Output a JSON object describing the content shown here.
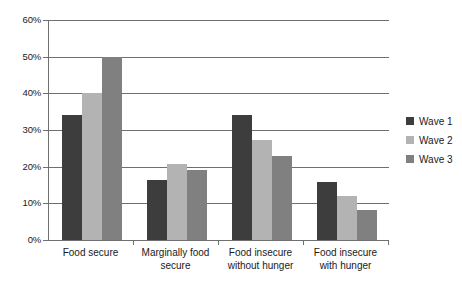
{
  "chart_data": {
    "type": "bar",
    "title": "",
    "subtitle": "",
    "xlabel": "",
    "ylabel": "",
    "categories": [
      "Food secure",
      "Marginally food secure",
      "Food insecure without hunger",
      "Food insecure with hunger"
    ],
    "category_lines": [
      [
        "Food secure"
      ],
      [
        "Marginally food",
        "secure"
      ],
      [
        "Food insecure",
        "without hunger"
      ],
      [
        "Food insecure",
        "with hunger"
      ]
    ],
    "series": [
      {
        "name": "Wave 1",
        "color": "#3d3d3d",
        "values": [
          34.0,
          16.5,
          34.0,
          15.7
        ]
      },
      {
        "name": "Wave 2",
        "color": "#b3b3b3",
        "values": [
          40.2,
          20.7,
          27.4,
          12.0
        ]
      },
      {
        "name": "Wave 3",
        "color": "#808080",
        "values": [
          50.0,
          19.0,
          22.9,
          8.2
        ]
      }
    ],
    "ylim": [
      0,
      60
    ],
    "ytick_values": [
      0,
      10,
      20,
      30,
      40,
      50,
      60
    ],
    "ytick_labels": [
      "0%",
      "10%",
      "20%",
      "30%",
      "40%",
      "50%",
      "60%"
    ],
    "grid": true,
    "grid_axis": "y",
    "legend_position": "right",
    "background_color": "#ffffff",
    "axis_color": "#6f6f6f"
  },
  "legend": {
    "entries": [
      {
        "label": "Wave 1"
      },
      {
        "label": "Wave 2"
      },
      {
        "label": "Wave 3"
      }
    ]
  }
}
